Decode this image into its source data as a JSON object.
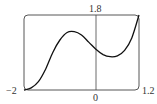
{
  "chart_data": {
    "type": "line",
    "title": "",
    "xlabel": "",
    "ylabel": "",
    "xlim": [
      -2,
      1.2
    ],
    "ylim": [
      0,
      1.8
    ],
    "grid": false,
    "tick_labels": {
      "x_min": "−2",
      "x_zero": "0",
      "x_max": "1.2",
      "y_max": "1.8"
    },
    "series": [
      {
        "name": "f(x)",
        "x": [
          -2.0,
          -1.8,
          -1.6,
          -1.4,
          -1.2,
          -1.0,
          -0.8,
          -0.6,
          -0.4,
          -0.2,
          0.0,
          0.2,
          0.4,
          0.6,
          0.8,
          1.0,
          1.2
        ],
        "y": [
          0.0,
          0.05,
          0.2,
          0.5,
          0.9,
          1.2,
          1.38,
          1.4,
          1.32,
          1.15,
          0.98,
          0.85,
          0.8,
          0.82,
          0.95,
          1.25,
          1.8
        ]
      }
    ]
  }
}
